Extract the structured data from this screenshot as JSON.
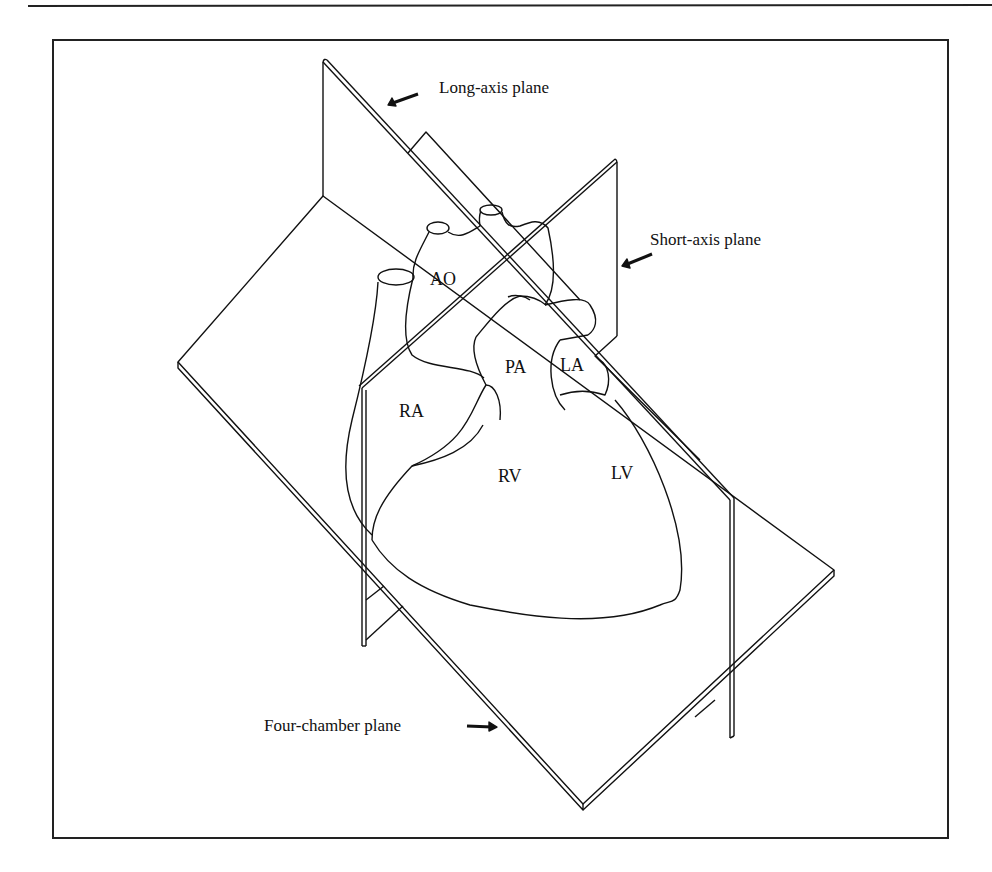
{
  "figure": {
    "colors": {
      "ink": "#111111",
      "paper": "#ffffff"
    }
  },
  "planes": {
    "long_axis": {
      "label": "Long-axis plane"
    },
    "short_axis": {
      "label": "Short-axis plane"
    },
    "four_chamber": {
      "label": "Four-chamber plane"
    }
  },
  "chambers": {
    "ao": "AO",
    "pa": "PA",
    "la": "LA",
    "ra": "RA",
    "rv": "RV",
    "lv": "LV"
  }
}
